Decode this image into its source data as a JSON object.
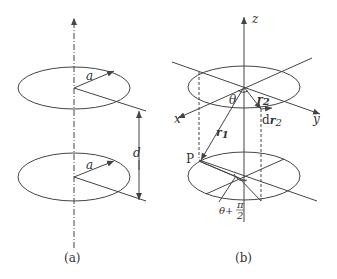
{
  "figure_a": {
    "caption": "(a)",
    "labels": {
      "radius_top": "a",
      "radius_bottom": "a",
      "separation": "d"
    }
  },
  "figure_b": {
    "caption": "(b)",
    "labels": {
      "axis_z": "z",
      "axis_x": "x",
      "axis_y": "y",
      "angle": "θ",
      "r2": "r",
      "r2_sub": "2",
      "dr2": "dr",
      "dr2_sub": "2",
      "r1": "r",
      "r1_sub": "1",
      "point": "P",
      "angle_offset": "θ+",
      "pi": "π",
      "two": "2"
    }
  },
  "colors": {
    "stroke": "#444444",
    "background": "#ffffff"
  }
}
